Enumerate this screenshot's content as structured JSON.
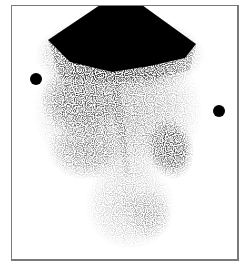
{
  "image": {
    "kind": "grayscale scintigraphy scan",
    "background_color": "#ffffff",
    "frame_color": "#7a7a7a",
    "ink_color": "#000000",
    "frame": {
      "x": 11,
      "y": 5,
      "width": 227,
      "height": 255
    },
    "markers": [
      {
        "name": "left-marker",
        "cx": 36,
        "cy": 79,
        "r": 6
      },
      {
        "name": "right-marker",
        "cx": 219,
        "cy": 111,
        "r": 6
      }
    ],
    "regions": [
      {
        "name": "top-intense-uptake",
        "shape": "polygon",
        "intensity": 1.0
      },
      {
        "name": "left-mid-uptake",
        "intensity": 0.75
      },
      {
        "name": "central-vertical-streak",
        "intensity": 0.7
      },
      {
        "name": "right-focal-uptake",
        "intensity": 0.85
      },
      {
        "name": "lower-diffuse-uptake",
        "intensity": 0.35
      }
    ]
  }
}
